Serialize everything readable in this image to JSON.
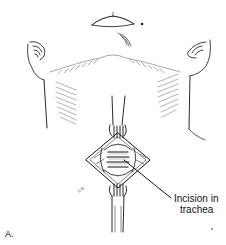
{
  "figure": {
    "panel_label": "A.",
    "callout": {
      "line1": "Incision in",
      "line2": "trachea"
    },
    "artist_initials": "n.k.",
    "colors": {
      "ink": "#111111",
      "background": "#ffffff"
    }
  }
}
